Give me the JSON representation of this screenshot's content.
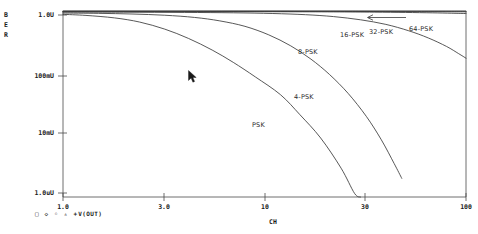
{
  "window": {
    "background": "#ffffff",
    "ink": "#1a1a1a"
  },
  "axes": {
    "y_label": "BER",
    "y_label_letters": [
      "B",
      "E",
      "R"
    ],
    "y_ticks": [
      "1.0U",
      "100mU",
      "10mU",
      "1.0uU"
    ],
    "x_label": "CH",
    "x_ticks": [
      "1.0",
      "3.0",
      "10",
      "30",
      "100"
    ]
  },
  "legend": {
    "markers": "□  ◇  ◦  ▵  +",
    "trace": "V(OUT)"
  },
  "curve_labels": [
    {
      "text": "PSK",
      "x": 252,
      "y": 121
    },
    {
      "text": "4-PSK",
      "x": 294,
      "y": 93
    },
    {
      "text": "8-PSK",
      "x": 298,
      "y": 48
    },
    {
      "text": "16-PSK",
      "x": 340,
      "y": 31
    },
    {
      "text": "32-PSK",
      "x": 369,
      "y": 28
    },
    {
      "text": "64-PSK",
      "x": 409,
      "y": 25
    }
  ],
  "annotations": {
    "arrow_to_64psk": "←"
  },
  "cursor": {
    "x": 188,
    "y": 70
  },
  "chart_data": {
    "type": "line",
    "title": "",
    "subtitle": "",
    "xlabel": "CH",
    "ylabel": "BER",
    "xscale": "log",
    "yscale": "log",
    "xlim": [
      1.0,
      100
    ],
    "ylim": [
      1e-06,
      1.0
    ],
    "x_tick_values": [
      1.0,
      3.0,
      10,
      30,
      100
    ],
    "x_tick_labels": [
      "1.0",
      "3.0",
      "10",
      "30",
      "100"
    ],
    "y_tick_values": [
      1.0,
      0.1,
      0.01,
      1e-06
    ],
    "y_tick_labels": [
      "1.0U",
      "100mU",
      "10mU",
      "1.0uU"
    ],
    "grid": false,
    "legend_position": "bottom-left",
    "legend_entries": [
      "V(OUT)"
    ],
    "annotations": [
      {
        "text": "PSK",
        "note": "lowest / leftmost waterfall curve"
      },
      {
        "text": "4-PSK",
        "note": "second waterfall curve"
      },
      {
        "text": "8-PSK",
        "note": "third waterfall curve"
      },
      {
        "text": "16-PSK",
        "note": "near-flat upper curve"
      },
      {
        "text": "32-PSK",
        "note": "near-flat upper curve"
      },
      {
        "text": "64-PSK",
        "note": "topmost near-flat curve, arrow points left"
      }
    ],
    "series": [
      {
        "name": "PSK",
        "points": [
          [
            1.0,
            0.78
          ],
          [
            1.3,
            0.72
          ],
          [
            1.8,
            0.6
          ],
          [
            2.4,
            0.44
          ],
          [
            3.2,
            0.26
          ],
          [
            4.2,
            0.13
          ],
          [
            5.5,
            0.055
          ],
          [
            7.0,
            0.022
          ],
          [
            9.0,
            0.0075
          ],
          [
            12.0,
            0.002
          ],
          [
            15.0,
            0.00045
          ],
          [
            19.0,
            8e-05
          ],
          [
            24.0,
            8.5e-06
          ],
          [
            28.0,
            1.3e-06
          ],
          [
            30.0,
            1e-06
          ]
        ]
      },
      {
        "name": "4-PSK",
        "points": [
          [
            1.0,
            0.86
          ],
          [
            1.5,
            0.84
          ],
          [
            2.2,
            0.8
          ],
          [
            3.2,
            0.73
          ],
          [
            4.5,
            0.62
          ],
          [
            6.0,
            0.48
          ],
          [
            8.0,
            0.32
          ],
          [
            10.5,
            0.17
          ],
          [
            13.5,
            0.075
          ],
          [
            17.0,
            0.028
          ],
          [
            21.0,
            0.009
          ],
          [
            26.0,
            0.0022
          ],
          [
            32.0,
            0.0004
          ],
          [
            38.0,
            7e-05
          ],
          [
            44.0,
            1.2e-05
          ],
          [
            48.0,
            4e-06
          ]
        ]
      },
      {
        "name": "8-PSK",
        "points": [
          [
            1.0,
            0.92
          ],
          [
            2.0,
            0.915
          ],
          [
            4.0,
            0.9
          ],
          [
            7.0,
            0.875
          ],
          [
            11.0,
            0.83
          ],
          [
            16.0,
            0.76
          ],
          [
            22.0,
            0.66
          ],
          [
            30.0,
            0.52
          ],
          [
            40.0,
            0.37
          ],
          [
            52.0,
            0.23
          ],
          [
            65.0,
            0.135
          ],
          [
            80.0,
            0.072
          ],
          [
            92.0,
            0.042
          ],
          [
            100.0,
            0.03
          ]
        ]
      },
      {
        "name": "16-PSK",
        "points": [
          [
            1.0,
            0.955
          ],
          [
            5.0,
            0.952
          ],
          [
            12.0,
            0.945
          ],
          [
            22.0,
            0.935
          ],
          [
            35.0,
            0.918
          ],
          [
            50.0,
            0.898
          ],
          [
            68.0,
            0.872
          ],
          [
            85.0,
            0.848
          ],
          [
            100.0,
            0.828
          ]
        ]
      },
      {
        "name": "32-PSK",
        "points": [
          [
            1.0,
            0.972
          ],
          [
            10.0,
            0.97
          ],
          [
            25.0,
            0.966
          ],
          [
            45.0,
            0.96
          ],
          [
            65.0,
            0.953
          ],
          [
            85.0,
            0.945
          ],
          [
            100.0,
            0.939
          ]
        ]
      },
      {
        "name": "64-PSK",
        "points": [
          [
            1.0,
            0.985
          ],
          [
            15.0,
            0.984
          ],
          [
            35.0,
            0.982
          ],
          [
            60.0,
            0.98
          ],
          [
            85.0,
            0.978
          ],
          [
            100.0,
            0.977
          ]
        ]
      }
    ]
  }
}
